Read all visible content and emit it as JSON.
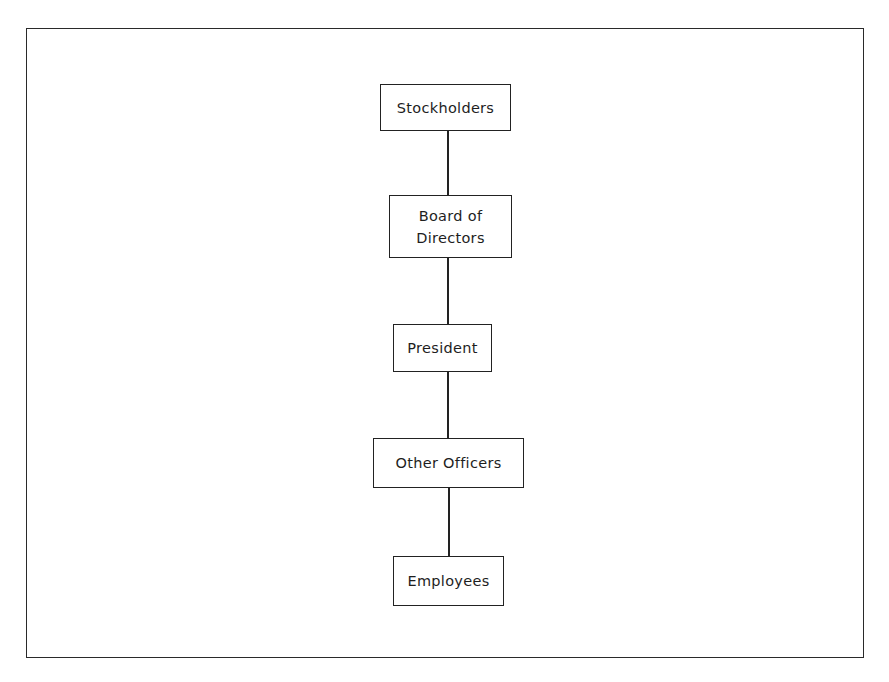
{
  "diagram": {
    "type": "organization-chart",
    "orientation": "vertical",
    "nodes": [
      {
        "id": "stockholders",
        "label": "Stockholders"
      },
      {
        "id": "board",
        "label": "Board of\nDirectors"
      },
      {
        "id": "president",
        "label": "President"
      },
      {
        "id": "officers",
        "label": "Other Officers"
      },
      {
        "id": "employees",
        "label": "Employees"
      }
    ],
    "edges": [
      {
        "from": "stockholders",
        "to": "board"
      },
      {
        "from": "board",
        "to": "president"
      },
      {
        "from": "president",
        "to": "officers"
      },
      {
        "from": "officers",
        "to": "employees"
      }
    ],
    "colors": {
      "line": "#222222",
      "background": "#ffffff",
      "text": "#1e1e1e"
    }
  }
}
